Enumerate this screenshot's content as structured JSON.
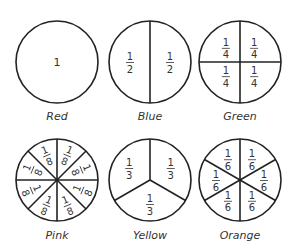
{
  "stroke_color": "#222222",
  "circles": [
    {
      "name": "Red",
      "label": "Red",
      "parts": 1,
      "fraction": "1",
      "cx": 57,
      "cy": 62
    },
    {
      "name": "Blue",
      "label": "Blue",
      "parts": 2,
      "fraction": "1/2",
      "cx": 150,
      "cy": 62
    },
    {
      "name": "Green",
      "label": "Green",
      "parts": 4,
      "fraction": "1/4",
      "cx": 240,
      "cy": 62
    },
    {
      "name": "Pink",
      "label": "Pink",
      "parts": 8,
      "fraction": "1/8",
      "cx": 57,
      "cy": 180
    },
    {
      "name": "Yellow",
      "label": "Yellow",
      "parts": 3,
      "fraction": "1/3",
      "cx": 150,
      "cy": 180
    },
    {
      "name": "Orange",
      "label": "Orange",
      "parts": 6,
      "fraction": "1/6",
      "cx": 240,
      "cy": 180
    }
  ]
}
